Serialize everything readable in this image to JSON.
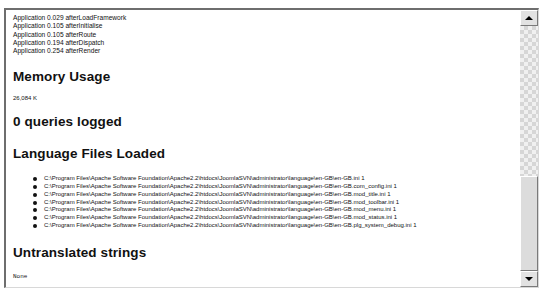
{
  "timing": {
    "lines": [
      "Application 0.029 afterLoadFramework",
      "Application 0.105 afterInitialise",
      "Application 0.105 afterRoute",
      "Application 0.194 afterDispatch",
      "Application 0.254 afterRender"
    ]
  },
  "memory": {
    "heading": "Memory Usage",
    "value": "26,084 K"
  },
  "queries": {
    "heading": "0 queries logged"
  },
  "language": {
    "heading": "Language Files Loaded",
    "files": [
      "C:\\Program Files\\Apache Software Foundation\\Apache2.2\\htdocs\\JoomlaSVN\\administrator\\language\\en-GB\\en-GB.ini 1",
      "C:\\Program Files\\Apache Software Foundation\\Apache2.2\\htdocs\\JoomlaSVN\\administrator\\language\\en-GB\\en-GB.com_config.ini 1",
      "C:\\Program Files\\Apache Software Foundation\\Apache2.2\\htdocs\\JoomlaSVN\\administrator\\language\\en-GB\\en-GB.mod_title.ini 1",
      "C:\\Program Files\\Apache Software Foundation\\Apache2.2\\htdocs\\JoomlaSVN\\administrator\\language\\en-GB\\en-GB.mod_toolbar.ini 1",
      "C:\\Program Files\\Apache Software Foundation\\Apache2.2\\htdocs\\JoomlaSVN\\administrator\\language\\en-GB\\en-GB.mod_menu.ini 1",
      "C:\\Program Files\\Apache Software Foundation\\Apache2.2\\htdocs\\JoomlaSVN\\administrator\\language\\en-GB\\en-GB.mod_status.ini 1",
      "C:\\Program Files\\Apache Software Foundation\\Apache2.2\\htdocs\\JoomlaSVN\\administrator\\language\\en-GB\\en-GB.plg_system_debug.ini 1"
    ]
  },
  "untranslated": {
    "heading": "Untranslated strings",
    "value": "None"
  },
  "scrollbar": {
    "up_icon": "arrow-up-icon",
    "down_icon": "arrow-down-icon"
  }
}
